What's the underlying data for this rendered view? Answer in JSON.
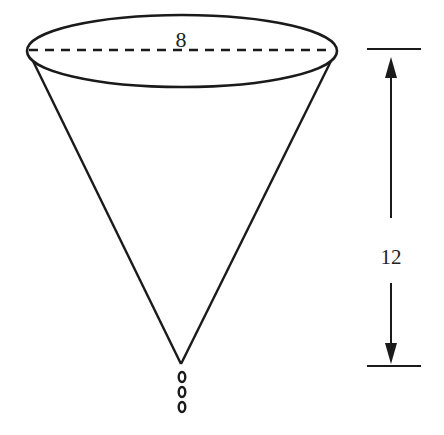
{
  "figure": {
    "type": "cone-diagram",
    "labels": {
      "diameter": "8",
      "height": "12"
    },
    "colors": {
      "stroke": "#1a1a1a",
      "background": "#ffffff"
    },
    "drips": 3
  }
}
